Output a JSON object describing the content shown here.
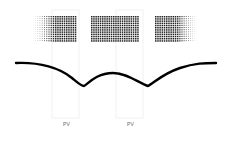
{
  "diagram": {
    "labels": [
      {
        "text": "PV",
        "x": 66,
        "y": 124
      },
      {
        "text": "PV",
        "x": 130,
        "y": 124
      }
    ],
    "dot_panels": [
      {
        "name": "left",
        "x": 33,
        "y": 16,
        "w": 46,
        "h": 28,
        "fade": "left"
      },
      {
        "name": "center",
        "x": 91,
        "y": 16,
        "w": 50,
        "h": 28,
        "fade": "none"
      },
      {
        "name": "right",
        "x": 155,
        "y": 16,
        "w": 46,
        "h": 28,
        "fade": "right"
      }
    ],
    "curve_color": "#000000",
    "outline_color": "#e6e6e6"
  }
}
